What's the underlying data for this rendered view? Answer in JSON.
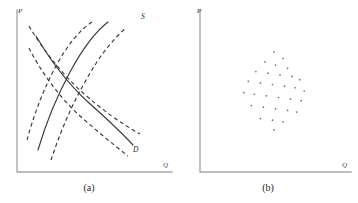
{
  "figure": {
    "background_color": "#ffffff",
    "axis_color": "#a9a9ad",
    "curve_color": "#3a3a3a",
    "scatter_color": "#6f6f77"
  },
  "panels": [
    {
      "id": "a",
      "caption": "(a)",
      "y_axis_label": "P",
      "x_axis_label": "Q",
      "curve_labels": {
        "supply": "S",
        "demand": "D"
      }
    },
    {
      "id": "b",
      "caption": "(b)",
      "y_axis_label": "P",
      "x_axis_label": "Q",
      "curve_labels": {
        "supply": "",
        "demand": ""
      }
    }
  ],
  "chart_data": [
    {
      "type": "line",
      "title": "(a)",
      "xlabel": "Q",
      "ylabel": "P",
      "xlim": [
        0,
        100
      ],
      "ylim": [
        0,
        100
      ],
      "grid": false,
      "legend_position": "inline-curve-end",
      "annotations": [
        "S",
        "D"
      ],
      "series": [
        {
          "name": "S",
          "style": "solid",
          "label": "S",
          "x": [
            12,
            22,
            34,
            46,
            58,
            70,
            82,
            92
          ],
          "y": [
            8,
            20,
            34,
            48,
            62,
            75,
            87,
            95
          ]
        },
        {
          "name": "S-left",
          "style": "dashed",
          "label": "",
          "x": [
            6,
            16,
            27,
            38,
            50,
            62,
            74,
            84
          ],
          "y": [
            10,
            23,
            37,
            51,
            64,
            77,
            88,
            95
          ]
        },
        {
          "name": "S-right",
          "style": "dashed",
          "label": "",
          "x": [
            22,
            32,
            44,
            56,
            68,
            78,
            88,
            96
          ],
          "y": [
            6,
            18,
            32,
            46,
            60,
            72,
            84,
            92
          ]
        },
        {
          "name": "D",
          "style": "solid",
          "label": "D",
          "x": [
            8,
            20,
            32,
            46,
            60,
            74,
            86,
            94
          ],
          "y": [
            88,
            74,
            60,
            46,
            33,
            22,
            14,
            10
          ]
        },
        {
          "name": "D-upper",
          "style": "dashed",
          "label": "",
          "x": [
            8,
            20,
            34,
            48,
            62,
            76,
            88,
            96
          ],
          "y": [
            95,
            84,
            70,
            56,
            43,
            31,
            22,
            17
          ]
        },
        {
          "name": "D-lower",
          "style": "dashed",
          "label": "",
          "x": [
            6,
            18,
            30,
            42,
            56,
            70,
            82,
            90
          ],
          "y": [
            76,
            62,
            49,
            37,
            26,
            17,
            10,
            6
          ]
        }
      ]
    },
    {
      "type": "scatter",
      "title": "(b)",
      "xlabel": "Q",
      "ylabel": "P",
      "xlim": [
        0,
        100
      ],
      "ylim": [
        0,
        100
      ],
      "grid": false,
      "legend_position": "none",
      "point_count": 31,
      "points": [
        [
          49,
          74
        ],
        [
          55,
          70
        ],
        [
          43,
          68
        ],
        [
          50,
          66
        ],
        [
          58,
          64
        ],
        [
          37,
          62
        ],
        [
          45,
          61
        ],
        [
          53,
          60
        ],
        [
          61,
          59
        ],
        [
          66,
          57
        ],
        [
          32,
          56
        ],
        [
          40,
          55
        ],
        [
          48,
          54
        ],
        [
          56,
          53
        ],
        [
          63,
          52
        ],
        [
          69,
          50
        ],
        [
          29,
          49
        ],
        [
          36,
          48
        ],
        [
          44,
          47
        ],
        [
          52,
          46
        ],
        [
          60,
          45
        ],
        [
          67,
          44
        ],
        [
          34,
          41
        ],
        [
          42,
          40
        ],
        [
          50,
          39
        ],
        [
          58,
          38
        ],
        [
          64,
          37
        ],
        [
          40,
          33
        ],
        [
          48,
          32
        ],
        [
          55,
          31
        ],
        [
          49,
          26
        ]
      ]
    }
  ]
}
